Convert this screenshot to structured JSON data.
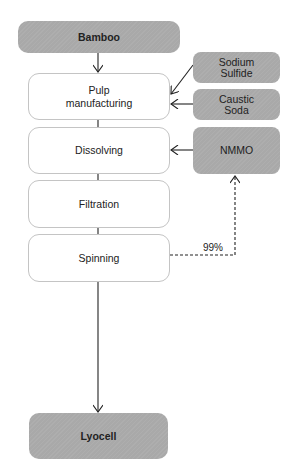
{
  "diagram": {
    "type": "process-flow",
    "source": {
      "label": "Bamboo"
    },
    "steps": [
      {
        "label_line1": "Pulp",
        "label_line2": "manufacturing"
      },
      {
        "label": "Dissolving"
      },
      {
        "label": "Filtration"
      },
      {
        "label": "Spinning"
      }
    ],
    "inputs": [
      {
        "label_line1": "Sodium",
        "label_line2": "Sulfide",
        "target": "Pulp manufacturing"
      },
      {
        "label_line1": "Caustic",
        "label_line2": "Soda",
        "target": "Pulp manufacturing"
      },
      {
        "label": "NMMO",
        "target": "Dissolving"
      }
    ],
    "recycle": {
      "from": "Spinning",
      "to": "NMMO",
      "label": "99%",
      "style": "dashed"
    },
    "product": {
      "label": "Lyocell"
    },
    "colors": {
      "input_fill": "#a9a9a9",
      "step_border": "#c4c4c4",
      "line": "#222222"
    }
  }
}
